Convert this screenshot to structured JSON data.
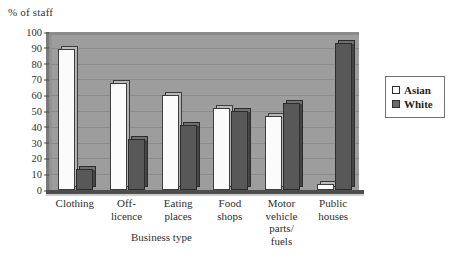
{
  "chart_data": {
    "type": "bar",
    "title": "",
    "ylabel": "% of staff",
    "xlabel": "Business type",
    "categories": [
      "Clothing",
      "Off-\nlicence",
      "Eating\nplaces",
      "Food\nshops",
      "Motor\nvehicle\nparts/\nfuels",
      "Public\nhouses"
    ],
    "series": [
      {
        "name": "Asian",
        "values": [
          89,
          68,
          60,
          52,
          47,
          4
        ],
        "color": "#ffffff"
      },
      {
        "name": "White",
        "values": [
          13,
          32,
          41,
          50,
          55,
          93
        ],
        "color": "#585858"
      }
    ],
    "ylim": [
      0,
      100
    ],
    "ytick_values": [
      100,
      90,
      80,
      70,
      60,
      50,
      40,
      30,
      20,
      10,
      0
    ],
    "grid": true,
    "legend_position": "right",
    "plot_background": "#9d9d9d"
  },
  "legend": {
    "entries": [
      {
        "label": "Asian",
        "swatch": "hollow-square-icon"
      },
      {
        "label": "White",
        "swatch": "filled-square-icon"
      }
    ]
  }
}
